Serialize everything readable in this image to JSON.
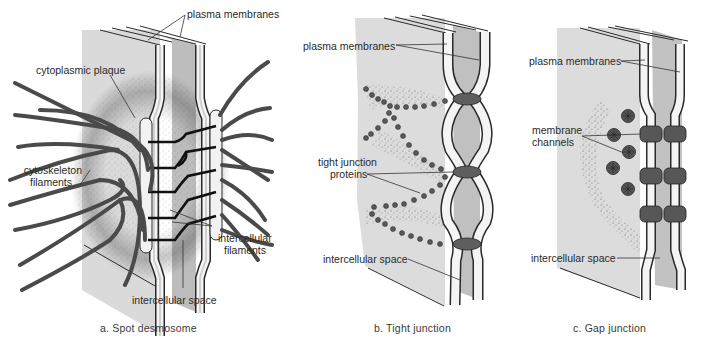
{
  "figure": {
    "panels": [
      {
        "id": "a",
        "caption": "a.  Spot desmosome",
        "labels": {
          "plasma_membranes": "plasma membranes",
          "cytoplasmic_plaque": "cytoplasmic plaque",
          "cytoskeleton_filaments_1": "cytoskeleton",
          "cytoskeleton_filaments_2": "filaments",
          "intercellular_filaments_1": "intercellular",
          "intercellular_filaments_2": "filaments",
          "intercellular_space": "intercellular space"
        }
      },
      {
        "id": "b",
        "caption": "b.  Tight junction",
        "labels": {
          "plasma_membranes": "plasma membranes",
          "tight_junction_proteins_1": "tight junction",
          "tight_junction_proteins_2": "proteins",
          "intercellular_space": "intercellular space"
        }
      },
      {
        "id": "c",
        "caption": "c.  Gap junction",
        "labels": {
          "plasma_membranes": "plasma membranes",
          "membrane_channels_1": "membrane",
          "membrane_channels_2": "channels",
          "intercellular_space": "intercellular space"
        }
      }
    ],
    "colors": {
      "cell_light": "#d9d9d9",
      "cell_dark": "#b8b8b8",
      "membrane_white": "#f4f4f4",
      "filament": "#4a4a4a",
      "protein": "#5e5e5e",
      "outline": "#2a2a2a"
    }
  }
}
